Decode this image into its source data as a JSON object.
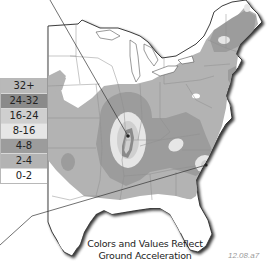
{
  "map": {
    "region": "Eastern United States",
    "caption_line1": "Colors and Values Reflect",
    "caption_line2": "Ground Acceleration",
    "figure_id": "12.08.a7"
  },
  "legend": {
    "items": [
      {
        "label": "32+",
        "color": "#b9b9b9"
      },
      {
        "label": "24-32",
        "color": "#8a8a8a"
      },
      {
        "label": "16-24",
        "color": "#cfcfcf"
      },
      {
        "label": "8-16",
        "color": "#e6e6e6"
      },
      {
        "label": "4-8",
        "color": "#9c9c9c"
      },
      {
        "label": "2-4",
        "color": "#b3b3b3"
      },
      {
        "label": "0-2",
        "color": "#ffffff"
      }
    ]
  },
  "colors": {
    "land": "#ffffff",
    "zone_2_4": "#b3b3b3",
    "zone_4_8": "#9c9c9c",
    "zone_8_16": "#e6e6e6",
    "zone_16_24": "#cfcfcf",
    "zone_24_32": "#8a8a8a",
    "state_borders": "#8f8f8f",
    "coast_shadow": "#3a3a3a",
    "pointer_lines": "#333333"
  }
}
